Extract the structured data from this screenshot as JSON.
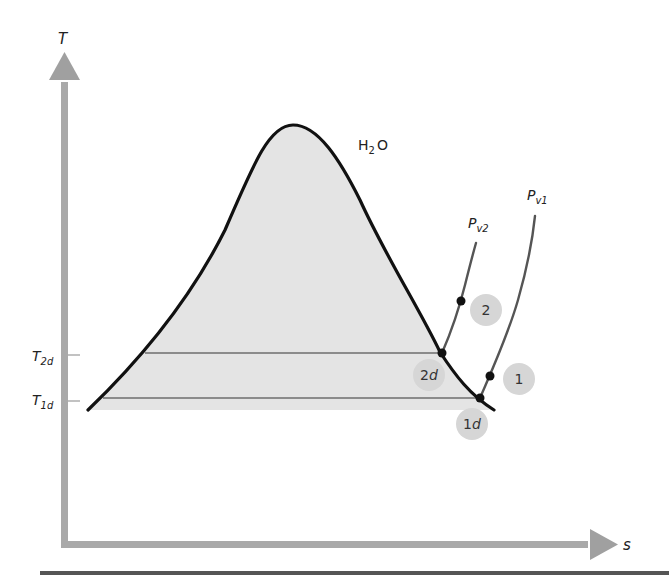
{
  "diagram": {
    "type": "T-s diagram",
    "substance_label": {
      "main": "H",
      "sub": "2",
      "tail": "O"
    },
    "axes": {
      "y_label": "T",
      "x_label": "s"
    },
    "temperature_ticks": [
      {
        "main": "T",
        "sub": "2d"
      },
      {
        "main": "T",
        "sub": "1d"
      }
    ],
    "isobars": [
      {
        "main": "P",
        "sub": "v2"
      },
      {
        "main": "P",
        "sub": "v1"
      }
    ],
    "states": [
      {
        "id": "2",
        "main": "2",
        "italic": ""
      },
      {
        "id": "2d",
        "main": "2",
        "italic": "d"
      },
      {
        "id": "1",
        "main": "1",
        "italic": ""
      },
      {
        "id": "1d",
        "main": "1",
        "italic": "d"
      }
    ],
    "colors": {
      "axis": "#a9a9a9",
      "dome_fill": "#e4e4e4",
      "dome_line": "#111111",
      "isobar_line": "#555555",
      "state_circle": "#d6d6d6",
      "bottom_rule": "#555555"
    }
  }
}
